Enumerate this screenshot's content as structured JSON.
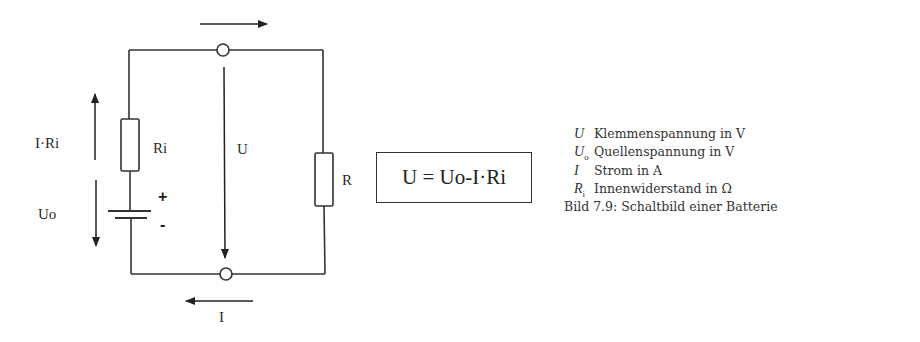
{
  "diagram": {
    "title": "Bild 7.9: Schaltbild einer Batterie",
    "labels": {
      "voltage_drop": "I·Ri",
      "source_voltage": "Uo",
      "internal_resistor": "Ri",
      "terminal_voltage": "U",
      "load_resistor": "R",
      "current": "I",
      "plus": "+",
      "minus": "-"
    },
    "formula": "U = Uo-I·Ri",
    "components": [
      {
        "type": "resistor",
        "name": "Ri"
      },
      {
        "type": "battery",
        "name": "Uo"
      },
      {
        "type": "resistor",
        "name": "R"
      },
      {
        "type": "terminal",
        "name": "top"
      },
      {
        "type": "terminal",
        "name": "bottom"
      }
    ],
    "arrows": [
      {
        "label": "I·Ri",
        "direction": "up"
      },
      {
        "label": "Uo",
        "direction": "down"
      },
      {
        "label": "U",
        "direction": "down"
      },
      {
        "label": "",
        "direction": "right",
        "position": "top"
      },
      {
        "label": "I",
        "direction": "left",
        "position": "bottom"
      }
    ]
  },
  "legend": {
    "items": [
      {
        "symbol": "U",
        "subscript": "",
        "description": "Klemmenspannung in V"
      },
      {
        "symbol": "U",
        "subscript": "o",
        "description": "Quellenspannung in V"
      },
      {
        "symbol": "I",
        "subscript": "",
        "description": "Strom in A"
      },
      {
        "symbol": "R",
        "subscript": "i",
        "description": "Innenwiderstand in Ω"
      }
    ],
    "caption": "Bild 7.9: Schaltbild einer Batterie"
  },
  "colors": {
    "line": "#333333",
    "text": "#2a2a2a",
    "background": "#ffffff"
  }
}
